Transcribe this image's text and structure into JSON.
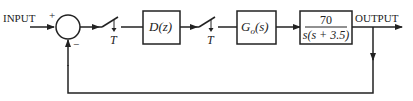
{
  "diagram": {
    "type": "block-diagram",
    "input_label": "INPUT",
    "output_label": "OUTPUT",
    "summing_junction": {
      "plus_sign": "+",
      "minus_sign": "−"
    },
    "sampler_1": {
      "label": "T"
    },
    "controller": {
      "label": "D(z)"
    },
    "sampler_2": {
      "label": "T"
    },
    "hold": {
      "label_main": "G",
      "label_sub": "o",
      "label_arg": "(s)"
    },
    "plant": {
      "numerator": "70",
      "denominator": "s(s + 3.5)"
    },
    "feedback": "unity negative feedback",
    "line_color": "#222222"
  }
}
